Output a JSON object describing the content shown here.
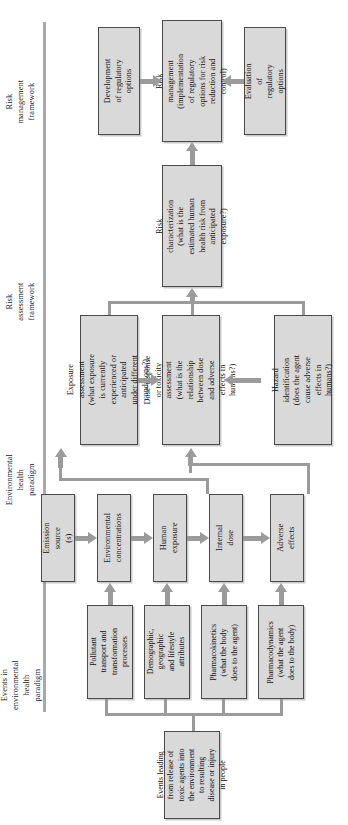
{
  "diagram": {
    "orientation": "rotated-90-ccw",
    "box_fill": "#d9d9d9",
    "box_border": "#4a4a4a",
    "connector_color": "#9b9b9b",
    "rule_color": "#a9a9a9"
  },
  "section_labels": [
    {
      "id": "risk-management-framework",
      "text": "Risk management framework"
    },
    {
      "id": "risk-assessment-framework",
      "text": "Risk assessment framework"
    },
    {
      "id": "environmental-health-paradigm",
      "text": "Environmental health paradigm"
    },
    {
      "id": "events-in-environmental-health-paradigm",
      "text": "Events in environmental health paradigm"
    }
  ],
  "nodes": {
    "development_of_regulatory_options": "Development of regulatory options",
    "risk_management": "Risk management (implementation of regulatory options for risk reduction and control)",
    "evaluation_of_regulatory_options": "Evaluation of regulatory options",
    "risk_characterization": "Risk characterization (what is the estimated human health risk from anticipated exposure?)",
    "exposure_assessment": "Exposure assessment (what exposure is currently experienced or anticipated under different conditions?)",
    "dose_response": "Dose-response or toxicity assessment (what is the relationship between dose and adverse effects in humans?)",
    "hazard_identification": "Hazard identification (does the agent cause adverse effects in humans?)",
    "emission_sources": "Emission source (s)",
    "environmental_concentrations": "Environmental concentrations",
    "human_exposure": "Human exposure",
    "internal_dose": "Internal dose",
    "adverse_effects": "Adverse effects",
    "pollutant_transport": "Pollutant transport and transformation processes",
    "demographic": "Demographic, geographic and lifestyle attributes",
    "pharmacokinetics": "Pharmacokinetics (what the body does to the agent)",
    "pharmacodynamics": "Pharmacodynamics (what the agent does to the body)",
    "events_leading": "Events leading from release of toxic agents into the environment to resulting disease or injury in people"
  }
}
